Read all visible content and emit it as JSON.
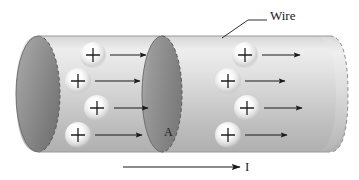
{
  "figure": {
    "background_color": "#ffffff"
  },
  "labels": {
    "wire": "Wire",
    "area": "A",
    "current": "I"
  },
  "charge_symbol": "+",
  "colors": {
    "tube_light": "#e8e8e8",
    "tube_mid": "#c2c2c2",
    "tube_dark": "#8f8f8f",
    "endcap_dark": "#7d7d7d",
    "cross_section_dark": "#8a8a8a",
    "outline": "#6a6a6a",
    "arrow": "#1a1a1a",
    "text": "#1a1a1a",
    "charge_glow": "#ffffff",
    "charge_edge": "#cfcfcf"
  },
  "geometry": {
    "tube_left_x": 38,
    "tube_right_x": 348,
    "tube_top_y": 36,
    "tube_bottom_y": 152,
    "endcap_rx": 22,
    "endcap_ry": 58,
    "cross_section_cx": 162,
    "cross_section_rx": 20,
    "cross_section_ry": 58
  },
  "charges": [
    {
      "id": "charge-1",
      "cx": 93,
      "cy": 55,
      "r": 13,
      "arrow_x1": 110,
      "arrow_x2": 146,
      "arrow_y": 55
    },
    {
      "id": "charge-2",
      "cx": 78,
      "cy": 81,
      "r": 13,
      "arrow_x1": 95,
      "arrow_x2": 140,
      "arrow_y": 81
    },
    {
      "id": "charge-3",
      "cx": 97,
      "cy": 108,
      "r": 13,
      "arrow_x1": 114,
      "arrow_x2": 148,
      "arrow_y": 108
    },
    {
      "id": "charge-4",
      "cx": 78,
      "cy": 135,
      "r": 13,
      "arrow_x1": 95,
      "arrow_x2": 142,
      "arrow_y": 135
    },
    {
      "id": "charge-5",
      "cx": 245,
      "cy": 55,
      "r": 13,
      "arrow_x1": 262,
      "arrow_x2": 300,
      "arrow_y": 55
    },
    {
      "id": "charge-6",
      "cx": 228,
      "cy": 81,
      "r": 13,
      "arrow_x1": 245,
      "arrow_x2": 285,
      "arrow_y": 81
    },
    {
      "id": "charge-7",
      "cx": 247,
      "cy": 108,
      "r": 13,
      "arrow_x1": 264,
      "arrow_x2": 302,
      "arrow_y": 108
    },
    {
      "id": "charge-8",
      "cx": 228,
      "cy": 135,
      "r": 13,
      "arrow_x1": 245,
      "arrow_x2": 287,
      "arrow_y": 135
    }
  ],
  "wire_leader": {
    "diagonal_from_x": 222,
    "diagonal_from_y": 38,
    "diagonal_to_x": 248,
    "diagonal_to_y": 20,
    "horizontal_to_x": 267,
    "horizontal_y": 20
  },
  "current_arrow": {
    "x1": 123,
    "x2": 240,
    "y": 167
  }
}
